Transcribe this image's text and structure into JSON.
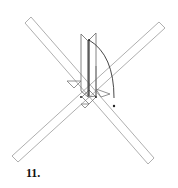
{
  "diagram": {
    "type": "origami-fold-step",
    "step_number": "11.",
    "elements": [
      "crossed diagonal strips",
      "vertical raised flap",
      "curved fold arrow"
    ],
    "colors": {
      "line": "#9a9a9a",
      "dark_line": "#333333",
      "background": "#ffffff"
    }
  }
}
